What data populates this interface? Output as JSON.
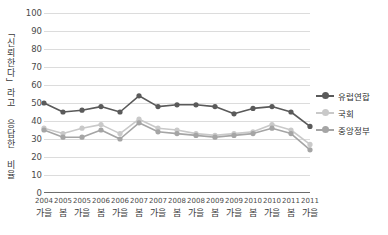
{
  "chart_data": {
    "type": "line",
    "title": "",
    "xlabel": "",
    "ylabel": "「신뢰한다」라고 응답한 비율",
    "ylim": [
      0,
      100
    ],
    "yticks": [
      0,
      10,
      20,
      30,
      40,
      50,
      60,
      70,
      80,
      90,
      100
    ],
    "grid": true,
    "legend_position": "right",
    "categories": [
      {
        "year": "2004",
        "season": "가을"
      },
      {
        "year": "2005",
        "season": "봄"
      },
      {
        "year": "2005",
        "season": "가을"
      },
      {
        "year": "2006",
        "season": "봄"
      },
      {
        "year": "2006",
        "season": "가을"
      },
      {
        "year": "2007",
        "season": "봄"
      },
      {
        "year": "2007",
        "season": "가을"
      },
      {
        "year": "2008",
        "season": "봄"
      },
      {
        "year": "2008",
        "season": "가을"
      },
      {
        "year": "2009",
        "season": "봄"
      },
      {
        "year": "2009",
        "season": "가을"
      },
      {
        "year": "2010",
        "season": "봄"
      },
      {
        "year": "2010",
        "season": "가을"
      },
      {
        "year": "2011",
        "season": "봄"
      },
      {
        "year": "2011",
        "season": "가을"
      }
    ],
    "series": [
      {
        "name": "유럽연합",
        "color": "#5a5a5a",
        "values": [
          50,
          45,
          46,
          48,
          45,
          54,
          48,
          49,
          49,
          48,
          44,
          47,
          48,
          45,
          37
        ]
      },
      {
        "name": "국회",
        "color": "#c9c9c9",
        "values": [
          36,
          33,
          36,
          38,
          33,
          41,
          36,
          35,
          33,
          32,
          33,
          34,
          38,
          35,
          27
        ]
      },
      {
        "name": "중앙정부",
        "color": "#a5a5a5",
        "values": [
          35,
          31,
          31,
          35,
          30,
          39,
          34,
          33,
          32,
          31,
          32,
          33,
          36,
          33,
          24
        ]
      }
    ]
  },
  "legend": {
    "items": [
      {
        "label": "유럽연합"
      },
      {
        "label": "국회"
      },
      {
        "label": "중앙정부"
      }
    ]
  },
  "colors": {
    "eu": "#5a5a5a",
    "parliament": "#c9c9c9",
    "government": "#a5a5a5",
    "grid": "#dcdcdc",
    "axis": "#6b6b6b"
  }
}
